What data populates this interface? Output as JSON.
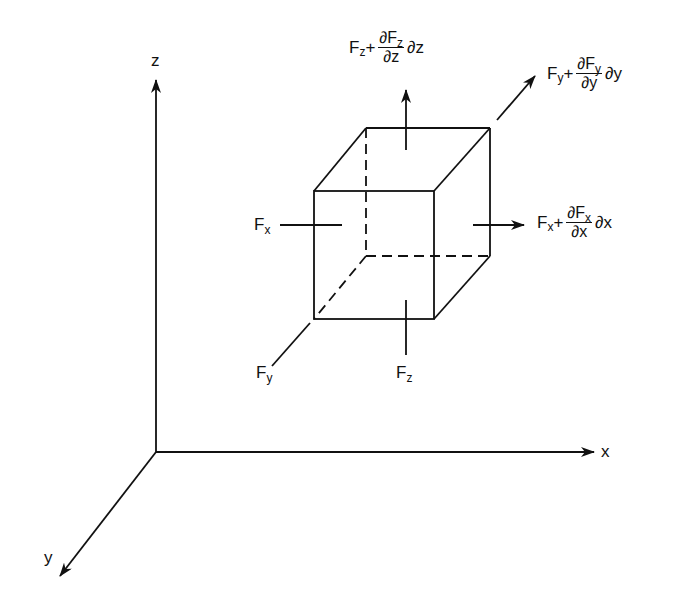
{
  "diagram": {
    "type": "3d-force-element",
    "axes": {
      "x_label": "x",
      "y_label": "y",
      "z_label": "z"
    },
    "forces_in": {
      "fx": {
        "symbol": "F",
        "sub": "x"
      },
      "fy": {
        "symbol": "F",
        "sub": "y"
      },
      "fz": {
        "symbol": "F",
        "sub": "z"
      }
    },
    "forces_out": {
      "fx": {
        "base": "F",
        "base_sub": "x",
        "plus": "+",
        "num": "∂F",
        "num_sub": "x",
        "den": "∂x",
        "tail": "∂x"
      },
      "fy": {
        "base": "F",
        "base_sub": "y",
        "plus": "+",
        "num": "∂F",
        "num_sub": "y",
        "den": "∂y",
        "tail": "∂y"
      },
      "fz": {
        "base": "F",
        "base_sub": "z",
        "plus": "+",
        "num": "∂F",
        "num_sub": "z",
        "den": "∂z",
        "tail": "∂z"
      }
    },
    "colors": {
      "stroke": "#111111",
      "background": "#ffffff"
    }
  }
}
